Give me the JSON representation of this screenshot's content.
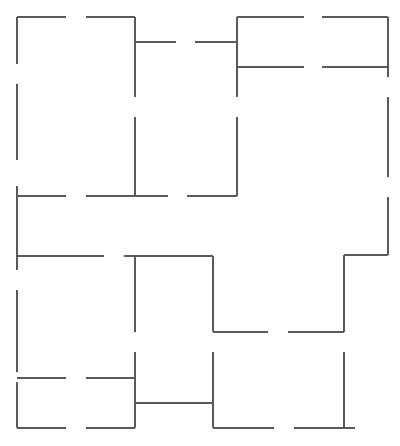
{
  "diagram": {
    "type": "floor-plan",
    "width": 400,
    "height": 446,
    "stroke_color": "#5a5a5a",
    "background": "#ffffff",
    "walls": [
      {
        "id": "top-left-1",
        "x1": 17,
        "y1": 17,
        "x2": 66,
        "y2": 17
      },
      {
        "id": "top-left-2",
        "x1": 86,
        "y1": 17,
        "x2": 135,
        "y2": 17
      },
      {
        "id": "x135-top",
        "x1": 135,
        "y1": 17,
        "x2": 135,
        "y2": 97
      },
      {
        "id": "x135-mid",
        "x1": 135,
        "y1": 117,
        "x2": 135,
        "y2": 196
      },
      {
        "id": "y42-1",
        "x1": 135,
        "y1": 42,
        "x2": 176,
        "y2": 42
      },
      {
        "id": "y42-2",
        "x1": 195,
        "y1": 42,
        "x2": 237,
        "y2": 42
      },
      {
        "id": "x237-top",
        "x1": 237,
        "y1": 17,
        "x2": 237,
        "y2": 97
      },
      {
        "id": "x237-mid",
        "x1": 237,
        "y1": 117,
        "x2": 237,
        "y2": 196
      },
      {
        "id": "top-right-1",
        "x1": 237,
        "y1": 17,
        "x2": 304,
        "y2": 17
      },
      {
        "id": "top-right-2",
        "x1": 322,
        "y1": 17,
        "x2": 388,
        "y2": 17
      },
      {
        "id": "y67-1",
        "x1": 237,
        "y1": 67,
        "x2": 304,
        "y2": 67
      },
      {
        "id": "y67-2",
        "x1": 322,
        "y1": 67,
        "x2": 388,
        "y2": 67
      },
      {
        "id": "x388-1",
        "x1": 388,
        "y1": 17,
        "x2": 388,
        "y2": 77
      },
      {
        "id": "x388-2",
        "x1": 388,
        "y1": 97,
        "x2": 388,
        "y2": 177
      },
      {
        "id": "x388-3",
        "x1": 388,
        "y1": 197,
        "x2": 388,
        "y2": 255
      },
      {
        "id": "y255-right",
        "x1": 344,
        "y1": 255,
        "x2": 388,
        "y2": 255
      },
      {
        "id": "x17-1",
        "x1": 17,
        "y1": 17,
        "x2": 17,
        "y2": 64
      },
      {
        "id": "x17-2",
        "x1": 17,
        "y1": 84,
        "x2": 17,
        "y2": 160
      },
      {
        "id": "x17-3",
        "x1": 17,
        "y1": 186,
        "x2": 17,
        "y2": 270
      },
      {
        "id": "x17-4",
        "x1": 17,
        "y1": 290,
        "x2": 17,
        "y2": 372
      },
      {
        "id": "x17-5",
        "x1": 17,
        "y1": 382,
        "x2": 17,
        "y2": 428
      },
      {
        "id": "y196-1",
        "x1": 17,
        "y1": 196,
        "x2": 66,
        "y2": 196
      },
      {
        "id": "y196-2",
        "x1": 86,
        "y1": 196,
        "x2": 168,
        "y2": 196
      },
      {
        "id": "y196-3",
        "x1": 187,
        "y1": 196,
        "x2": 237,
        "y2": 196
      },
      {
        "id": "y256-1",
        "x1": 17,
        "y1": 256,
        "x2": 104,
        "y2": 256
      },
      {
        "id": "y256-2",
        "x1": 124,
        "y1": 256,
        "x2": 213,
        "y2": 256
      },
      {
        "id": "x135-low-1",
        "x1": 135,
        "y1": 256,
        "x2": 135,
        "y2": 332
      },
      {
        "id": "x135-low-2",
        "x1": 135,
        "y1": 352,
        "x2": 135,
        "y2": 428
      },
      {
        "id": "x213-1",
        "x1": 213,
        "y1": 256,
        "x2": 213,
        "y2": 332
      },
      {
        "id": "x213-2",
        "x1": 213,
        "y1": 352,
        "x2": 213,
        "y2": 428
      },
      {
        "id": "y332-1",
        "x1": 213,
        "y1": 332,
        "x2": 268,
        "y2": 332
      },
      {
        "id": "y332-2",
        "x1": 288,
        "y1": 332,
        "x2": 344,
        "y2": 332
      },
      {
        "id": "x344-1",
        "x1": 344,
        "y1": 255,
        "x2": 344,
        "y2": 332
      },
      {
        "id": "x344-2",
        "x1": 344,
        "y1": 352,
        "x2": 344,
        "y2": 428
      },
      {
        "id": "y378-1",
        "x1": 17,
        "y1": 378,
        "x2": 66,
        "y2": 378
      },
      {
        "id": "y378-2",
        "x1": 86,
        "y1": 378,
        "x2": 135,
        "y2": 378
      },
      {
        "id": "y403",
        "x1": 135,
        "y1": 403,
        "x2": 213,
        "y2": 403
      },
      {
        "id": "y428-1",
        "x1": 17,
        "y1": 428,
        "x2": 66,
        "y2": 428
      },
      {
        "id": "y428-2",
        "x1": 86,
        "y1": 428,
        "x2": 135,
        "y2": 428
      },
      {
        "id": "y428-3",
        "x1": 213,
        "y1": 428,
        "x2": 274,
        "y2": 428
      },
      {
        "id": "y428-4",
        "x1": 294,
        "y1": 428,
        "x2": 355,
        "y2": 428
      }
    ]
  }
}
